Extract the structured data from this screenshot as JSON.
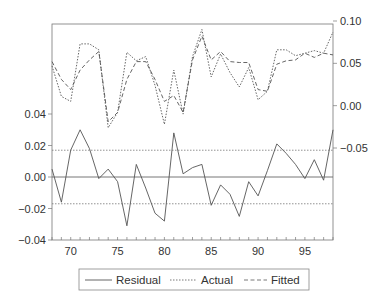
{
  "chart_data": {
    "type": "line",
    "title": "",
    "xlabel": "",
    "ylabel_left": "",
    "ylabel_right": "",
    "x": [
      68,
      69,
      70,
      71,
      72,
      73,
      74,
      75,
      76,
      77,
      78,
      79,
      80,
      81,
      82,
      83,
      84,
      85,
      86,
      87,
      88,
      89,
      90,
      91,
      92,
      93,
      94,
      95,
      96,
      97,
      98
    ],
    "xlim": [
      68,
      98
    ],
    "x_ticks": [
      70,
      75,
      80,
      85,
      90,
      95
    ],
    "x_tick_labels": [
      "70",
      "75",
      "80",
      "85",
      "90",
      "95"
    ],
    "y_left": {
      "range": [
        -0.04,
        0.04
      ],
      "ticks": [
        0.04,
        0.02,
        0.0,
        -0.02,
        -0.04
      ],
      "tick_labels": [
        "0.04",
        "0.02",
        "0.00",
        "−0.02",
        "−0.04"
      ]
    },
    "y_right": {
      "range": [
        -0.05,
        0.1
      ],
      "ticks": [
        0.1,
        0.05,
        0.0,
        -0.05
      ],
      "tick_labels": [
        "0.10",
        "0.05",
        "0.00",
        "−0.05"
      ]
    },
    "reference_lines_left": {
      "zero": 0.0,
      "upper_band": 0.017,
      "lower_band": -0.017
    },
    "series": [
      {
        "name": "Residual",
        "axis": "left",
        "style": "solid",
        "values": [
          0.005,
          -0.016,
          0.017,
          0.03,
          0.018,
          -0.001,
          0.005,
          -0.003,
          -0.031,
          0.008,
          -0.007,
          -0.023,
          -0.028,
          0.028,
          0.002,
          0.006,
          0.008,
          -0.018,
          -0.005,
          -0.011,
          -0.025,
          -0.003,
          -0.012,
          0.004,
          0.021,
          0.015,
          0.008,
          -0.001,
          0.011,
          -0.002,
          0.03
        ]
      },
      {
        "name": "Actual",
        "axis": "right",
        "style": "dotted",
        "values": [
          0.047,
          0.011,
          0.005,
          0.073,
          0.073,
          0.066,
          -0.026,
          -0.008,
          0.063,
          0.053,
          0.058,
          0.024,
          -0.022,
          0.042,
          -0.01,
          0.058,
          0.09,
          0.034,
          0.061,
          0.039,
          0.022,
          0.045,
          0.007,
          0.017,
          0.066,
          0.066,
          0.059,
          0.062,
          0.065,
          0.062,
          0.087
        ]
      },
      {
        "name": "Fitted",
        "axis": "right",
        "style": "dashed",
        "values": [
          0.052,
          0.031,
          0.019,
          0.042,
          0.054,
          0.064,
          -0.019,
          -0.008,
          0.031,
          0.052,
          0.052,
          0.031,
          0.005,
          0.012,
          -0.008,
          0.054,
          0.082,
          0.054,
          0.064,
          0.052,
          0.051,
          0.051,
          0.019,
          0.017,
          0.049,
          0.053,
          0.054,
          0.062,
          0.057,
          0.062,
          0.06
        ]
      }
    ],
    "legend": {
      "position": "bottom",
      "entries": [
        "Residual",
        "Actual",
        "Fitted"
      ]
    },
    "grid": false
  },
  "legend": {
    "residual": "Residual",
    "actual": "Actual",
    "fitted": "Fitted"
  },
  "colors": {
    "line": "#555555",
    "axis": "#666666",
    "text": "#333333"
  }
}
